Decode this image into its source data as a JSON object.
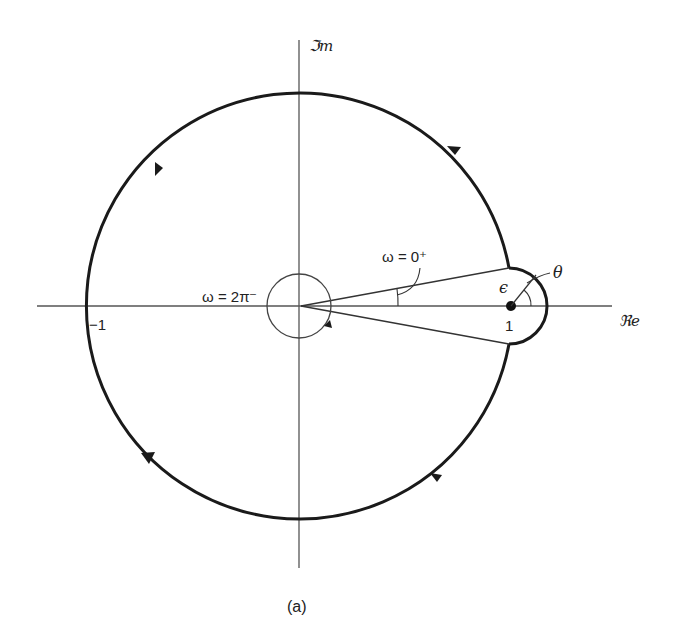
{
  "figure": {
    "caption": "(a)",
    "axes": {
      "imag_label": "ℑm",
      "real_label": "ℜe",
      "minus_one_label": "−1",
      "one_label": "1"
    },
    "annotations": {
      "omega_zero_plus": "ω = 0⁺",
      "omega_two_pi_minus": "ω = 2π⁻",
      "epsilon": "ϵ",
      "theta": "θ"
    },
    "colors": {
      "stroke": "#1a1a1a",
      "background": "#ffffff"
    },
    "geometry": {
      "origin": [
        299,
        306
      ],
      "unit_circle_radius": 213,
      "small_origin_circle_radius": 32,
      "epsilon_circle_center": [
        511,
        306
      ],
      "epsilon_circle_radius": 38
    }
  }
}
